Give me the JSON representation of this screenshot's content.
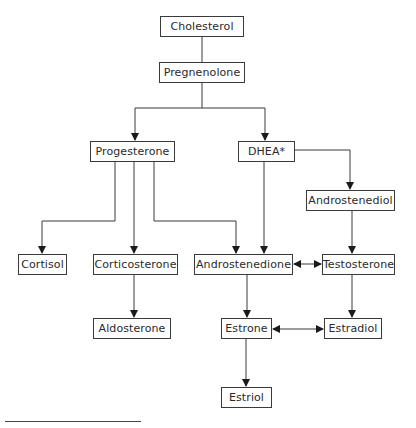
{
  "diagram": {
    "colors": {
      "line": "#3a3a3a",
      "box_border": "#3a3a3a",
      "text": "#2a2a2a",
      "background": "#ffffff"
    },
    "nodes": [
      {
        "id": "cholesterol",
        "label": "Cholesterol",
        "x": 160,
        "y": 16,
        "w": 84,
        "h": 21
      },
      {
        "id": "pregnenolone",
        "label": "Pregnenolone",
        "x": 159,
        "y": 62,
        "w": 86,
        "h": 21
      },
      {
        "id": "progesterone",
        "label": "Progesterone",
        "x": 90,
        "y": 141,
        "w": 85,
        "h": 21
      },
      {
        "id": "dhea",
        "label": "DHEA*",
        "x": 238,
        "y": 141,
        "w": 57,
        "h": 21
      },
      {
        "id": "androstenediol",
        "label": "Androstenediol",
        "x": 306,
        "y": 190,
        "w": 89,
        "h": 21
      },
      {
        "id": "cortisol",
        "label": "Cortisol",
        "x": 18,
        "y": 254,
        "w": 49,
        "h": 21
      },
      {
        "id": "corticosterone",
        "label": "Corticosterone",
        "x": 93,
        "y": 254,
        "w": 85,
        "h": 21
      },
      {
        "id": "androstenedione",
        "label": "Androstenedione",
        "x": 194,
        "y": 254,
        "w": 99,
        "h": 21
      },
      {
        "id": "testosterone",
        "label": "Testosterone",
        "x": 322,
        "y": 254,
        "w": 73,
        "h": 21
      },
      {
        "id": "aldosterone",
        "label": "Aldosterone",
        "x": 93,
        "y": 318,
        "w": 78,
        "h": 21
      },
      {
        "id": "estrone",
        "label": "Estrone",
        "x": 221,
        "y": 318,
        "w": 51,
        "h": 21
      },
      {
        "id": "estradiol",
        "label": "Estradiol",
        "x": 324,
        "y": 318,
        "w": 58,
        "h": 21
      },
      {
        "id": "estriol",
        "label": "Estriol",
        "x": 221,
        "y": 387,
        "w": 51,
        "h": 21
      }
    ],
    "edges": [
      {
        "from": "cholesterol",
        "to": "pregnenolone",
        "type": "line"
      },
      {
        "from": "pregnenolone",
        "to": "progesterone",
        "type": "arrow"
      },
      {
        "from": "pregnenolone",
        "to": "dhea",
        "type": "arrow"
      },
      {
        "from": "progesterone",
        "to": "cortisol",
        "type": "arrow"
      },
      {
        "from": "progesterone",
        "to": "corticosterone",
        "type": "arrow"
      },
      {
        "from": "progesterone",
        "to": "androstenedione",
        "type": "arrow"
      },
      {
        "from": "dhea",
        "to": "androstenedione",
        "type": "arrow"
      },
      {
        "from": "dhea",
        "to": "androstenediol",
        "type": "arrow"
      },
      {
        "from": "androstenediol",
        "to": "testosterone",
        "type": "arrow"
      },
      {
        "from": "androstenedione",
        "to": "testosterone",
        "type": "bidirectional"
      },
      {
        "from": "corticosterone",
        "to": "aldosterone",
        "type": "arrow"
      },
      {
        "from": "androstenedione",
        "to": "estrone",
        "type": "arrow"
      },
      {
        "from": "testosterone",
        "to": "estradiol",
        "type": "arrow"
      },
      {
        "from": "estrone",
        "to": "estradiol",
        "type": "bidirectional"
      },
      {
        "from": "estrone",
        "to": "estriol",
        "type": "arrow"
      }
    ],
    "footnote_rule": true
  }
}
